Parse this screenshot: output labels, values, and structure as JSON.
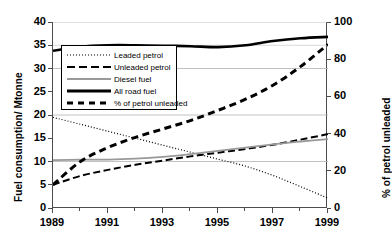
{
  "chart_data": {
    "type": "line",
    "title": "",
    "xlabel": "",
    "ylabel": "Fuel consumption/ Mtonne",
    "y2label": "% of petrol unleaded",
    "x": [
      1989,
      1990,
      1991,
      1992,
      1993,
      1994,
      1995,
      1996,
      1997,
      1998,
      1999
    ],
    "xlim": [
      1989,
      1999
    ],
    "ylim": [
      0,
      40
    ],
    "y2lim": [
      0,
      100
    ],
    "xticks": [
      1989,
      1991,
      1993,
      1995,
      1997,
      1999
    ],
    "xtick_labels": [
      "1989",
      "1991",
      "1993",
      "1995",
      "1997",
      "1999"
    ],
    "xminorticks": [
      1990,
      1992,
      1994,
      1996,
      1998
    ],
    "yticks": [
      0,
      5,
      10,
      15,
      20,
      25,
      30,
      35,
      40
    ],
    "ytick_labels": [
      "0",
      "5",
      "10",
      "15",
      "20",
      "25",
      "30",
      "35",
      "40"
    ],
    "y2ticks": [
      0,
      20,
      40,
      60,
      80,
      100
    ],
    "y2tick_labels": [
      "0",
      "20",
      "40",
      "60",
      "80",
      "100"
    ],
    "gridlines_y": [
      10,
      20,
      30,
      40
    ],
    "grid": true,
    "legend_position": "upper left",
    "series": [
      {
        "name": "Leaded petrol",
        "axis": "left",
        "style": "dotted",
        "color": "#000000",
        "values": [
          19.5,
          18.0,
          16.5,
          15.0,
          13.5,
          12.0,
          10.5,
          9.0,
          7.0,
          4.6,
          2.1
        ]
      },
      {
        "name": "Unleaded petrol",
        "axis": "left",
        "style": "dashed",
        "color": "#000000",
        "values": [
          5.0,
          6.9,
          8.2,
          9.3,
          10.2,
          11.1,
          11.9,
          12.7,
          13.6,
          14.7,
          15.9
        ]
      },
      {
        "name": "Diesel fuel",
        "axis": "left",
        "style": "solid-gray",
        "color": "#999999",
        "values": [
          10.3,
          10.4,
          10.4,
          10.6,
          11.0,
          11.6,
          12.3,
          13.0,
          13.7,
          14.3,
          14.8
        ]
      },
      {
        "name": "All road fuel",
        "axis": "left",
        "style": "solid-thick",
        "color": "#000000",
        "values": [
          33.8,
          34.7,
          35.0,
          35.0,
          34.9,
          34.8,
          34.6,
          35.0,
          35.9,
          36.5,
          36.8
        ]
      },
      {
        "name": "% of petrol unleaded",
        "axis": "right",
        "style": "dash-bold",
        "color": "#000000",
        "values": [
          12.5,
          25.0,
          32.5,
          38.0,
          42.5,
          47.0,
          52.5,
          58.5,
          66.0,
          76.0,
          88.0
        ]
      }
    ]
  },
  "legend": {
    "items": [
      {
        "label": "Leaded petrol",
        "swatch": "dotted-line-icon"
      },
      {
        "label": "Unleaded petrol",
        "swatch": "dashed-line-icon"
      },
      {
        "label": "Diesel fuel",
        "swatch": "gray-solid-line-icon"
      },
      {
        "label": "All road fuel",
        "swatch": "black-thick-line-icon"
      },
      {
        "label": "% of petrol unleaded",
        "swatch": "bold-dash-line-icon"
      }
    ]
  },
  "colors": {
    "axis": "#4d4d4d",
    "grid": "#b3b3b3",
    "diesel": "#999999",
    "line": "#000000"
  }
}
